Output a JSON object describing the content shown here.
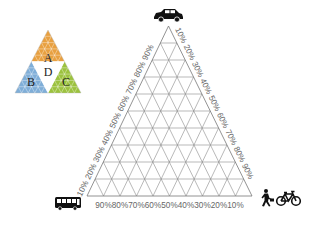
{
  "diagram": {
    "type": "ternary-plot",
    "axes": {
      "top": {
        "label": "car",
        "icon": "car-icon"
      },
      "bottom_left": {
        "label": "bus",
        "icon": "bus-icon"
      },
      "bottom_right": {
        "label": "walk / bike",
        "icons": [
          "pedestrian-icon",
          "bicycle-icon"
        ]
      }
    },
    "left_edge_ticks": [
      "10%",
      "20%",
      "30%",
      "40%",
      "50%",
      "60%",
      "70%",
      "80%",
      "90%"
    ],
    "right_edge_ticks": [
      "10%",
      "20%",
      "30%",
      "40%",
      "50%",
      "60%",
      "70%",
      "80%",
      "90%"
    ],
    "bottom_edge_ticks": [
      "90%",
      "80%",
      "70%",
      "60%",
      "50%",
      "40%",
      "30%",
      "20%",
      "10%"
    ],
    "grid_divisions": 10
  },
  "inset": {
    "regions": [
      {
        "label": "A",
        "color": "#E8A040"
      },
      {
        "label": "B",
        "color": "#7FAED8"
      },
      {
        "label": "C",
        "color": "#9CC23E"
      },
      {
        "label": "D",
        "color": "#FFFFFF"
      }
    ]
  }
}
